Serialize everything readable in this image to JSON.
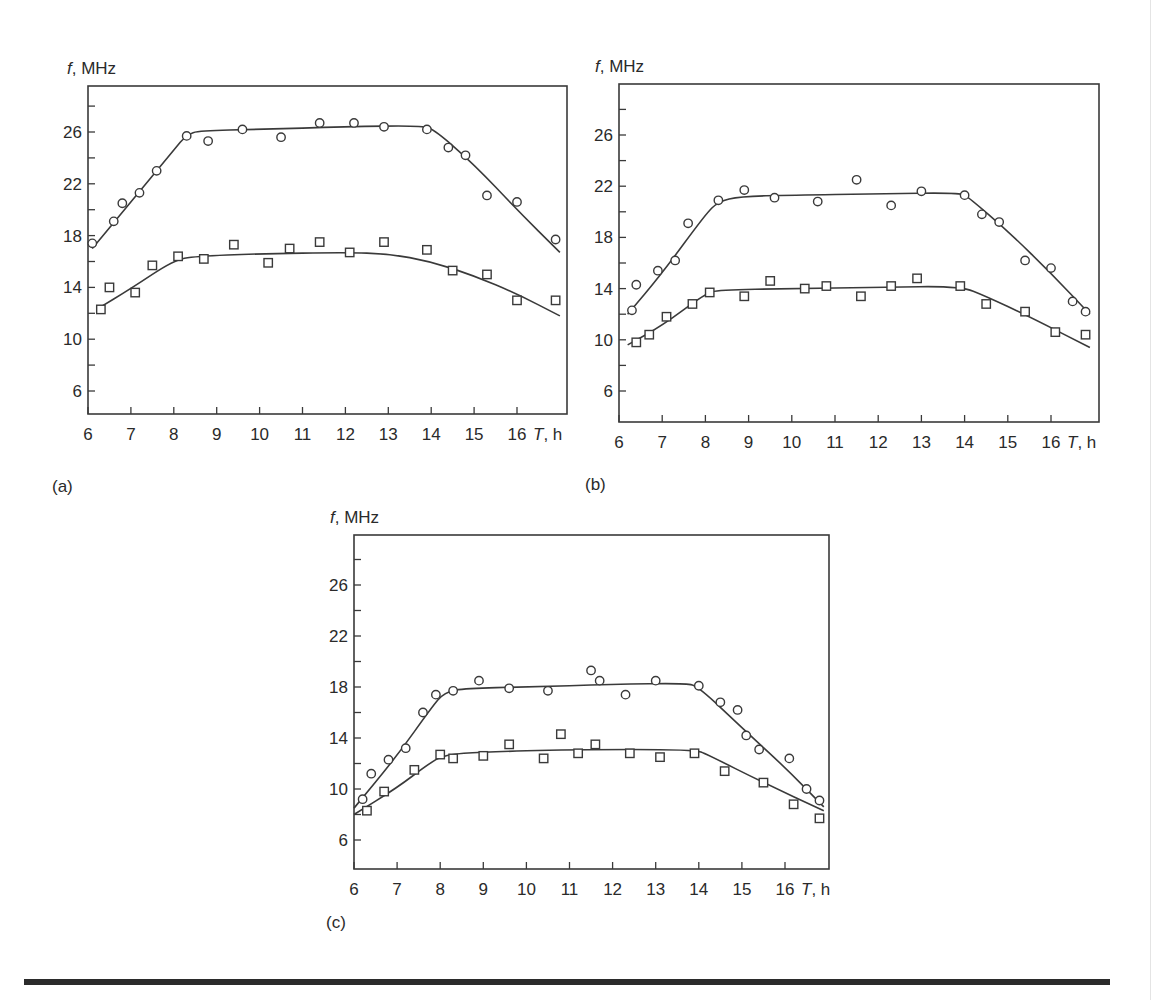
{
  "figure": {
    "y_unit_label": "f, MHz",
    "x_unit_label_italic": "T",
    "x_unit_label_rest": ", h",
    "panel_labels": [
      "(a)",
      "(b)",
      "(c)"
    ]
  },
  "chart_data": [
    {
      "type": "scatter",
      "panel": "(a)",
      "title": "",
      "xlabel": "T, h",
      "ylabel": "f, MHz",
      "xlim": [
        6,
        17
      ],
      "ylim": [
        4,
        30
      ],
      "x_ticks": [
        6,
        7,
        8,
        9,
        10,
        11,
        12,
        13,
        14,
        15,
        16
      ],
      "y_ticks_labeled": [
        6,
        10,
        14,
        18,
        22,
        26
      ],
      "y_ticks_minor": [
        8,
        12,
        16,
        20,
        24,
        28
      ],
      "grid": false,
      "legend": null,
      "series": [
        {
          "name": "circles",
          "marker": "circle",
          "points": [
            [
              6.1,
              17.4
            ],
            [
              6.6,
              19.1
            ],
            [
              6.8,
              20.5
            ],
            [
              7.2,
              21.3
            ],
            [
              7.6,
              23.0
            ],
            [
              8.3,
              25.7
            ],
            [
              8.8,
              25.3
            ],
            [
              9.6,
              26.2
            ],
            [
              10.5,
              25.6
            ],
            [
              11.4,
              26.7
            ],
            [
              12.2,
              26.7
            ],
            [
              12.9,
              26.4
            ],
            [
              13.9,
              26.2
            ],
            [
              14.4,
              24.8
            ],
            [
              14.8,
              24.2
            ],
            [
              15.3,
              21.1
            ],
            [
              16.0,
              20.6
            ],
            [
              16.9,
              17.7
            ]
          ],
          "fit_curve": [
            [
              6.1,
              17.0
            ],
            [
              7.0,
              20.6
            ],
            [
              8.0,
              24.6
            ],
            [
              8.3,
              25.8
            ],
            [
              8.6,
              26.1
            ],
            [
              10,
              26.2
            ],
            [
              12,
              26.4
            ],
            [
              13.8,
              26.5
            ],
            [
              14.1,
              26.1
            ],
            [
              15,
              23.5
            ],
            [
              16,
              20.0
            ],
            [
              17,
              16.7
            ]
          ]
        },
        {
          "name": "squares",
          "marker": "square",
          "points": [
            [
              6.3,
              12.3
            ],
            [
              6.5,
              14.0
            ],
            [
              7.1,
              13.6
            ],
            [
              7.5,
              15.7
            ],
            [
              8.1,
              16.4
            ],
            [
              8.7,
              16.2
            ],
            [
              9.4,
              17.3
            ],
            [
              10.2,
              15.9
            ],
            [
              10.7,
              17.0
            ],
            [
              11.4,
              17.5
            ],
            [
              12.1,
              16.7
            ],
            [
              12.9,
              17.5
            ],
            [
              13.9,
              16.9
            ],
            [
              14.5,
              15.3
            ],
            [
              15.3,
              15.0
            ],
            [
              16.0,
              13.0
            ],
            [
              16.9,
              13.0
            ]
          ],
          "fit_curve": [
            [
              6.2,
              12.3
            ],
            [
              7,
              13.9
            ],
            [
              8,
              16.1
            ],
            [
              8.5,
              16.4
            ],
            [
              10,
              16.6
            ],
            [
              12,
              16.7
            ],
            [
              13,
              16.6
            ],
            [
              14,
              16.0
            ],
            [
              15,
              14.9
            ],
            [
              16,
              13.5
            ],
            [
              17,
              11.8
            ]
          ]
        }
      ]
    },
    {
      "type": "scatter",
      "panel": "(b)",
      "title": "",
      "xlabel": "T, h",
      "ylabel": "f, MHz",
      "xlim": [
        6,
        17
      ],
      "ylim": [
        4,
        30
      ],
      "x_ticks": [
        6,
        7,
        8,
        9,
        10,
        11,
        12,
        13,
        14,
        15,
        16
      ],
      "y_ticks_labeled": [
        6,
        10,
        14,
        18,
        22,
        26
      ],
      "y_ticks_minor": [
        8,
        12,
        16,
        20,
        24,
        28
      ],
      "grid": false,
      "legend": null,
      "series": [
        {
          "name": "circles",
          "marker": "circle",
          "points": [
            [
              6.3,
              12.3
            ],
            [
              6.4,
              14.3
            ],
            [
              6.9,
              15.4
            ],
            [
              7.3,
              16.2
            ],
            [
              7.6,
              19.1
            ],
            [
              8.3,
              20.9
            ],
            [
              8.9,
              21.7
            ],
            [
              9.6,
              21.1
            ],
            [
              10.6,
              20.8
            ],
            [
              11.5,
              22.5
            ],
            [
              12.3,
              20.5
            ],
            [
              13.0,
              21.6
            ],
            [
              14.0,
              21.3
            ],
            [
              14.4,
              19.8
            ],
            [
              14.8,
              19.2
            ],
            [
              15.4,
              16.2
            ],
            [
              16.0,
              15.6
            ],
            [
              16.5,
              13.0
            ],
            [
              16.8,
              12.2
            ]
          ],
          "fit_curve": [
            [
              6.2,
              12.0
            ],
            [
              7,
              15.2
            ],
            [
              8,
              19.8
            ],
            [
              8.3,
              20.8
            ],
            [
              8.8,
              21.2
            ],
            [
              10,
              21.3
            ],
            [
              12,
              21.4
            ],
            [
              13.9,
              21.5
            ],
            [
              14.1,
              21.1
            ],
            [
              15,
              18.5
            ],
            [
              16,
              15.2
            ],
            [
              16.9,
              12.0
            ]
          ]
        },
        {
          "name": "squares",
          "marker": "square",
          "points": [
            [
              6.4,
              9.8
            ],
            [
              6.7,
              10.4
            ],
            [
              7.1,
              11.8
            ],
            [
              7.7,
              12.8
            ],
            [
              8.1,
              13.7
            ],
            [
              8.9,
              13.4
            ],
            [
              9.5,
              14.6
            ],
            [
              10.3,
              14.0
            ],
            [
              10.8,
              14.2
            ],
            [
              11.6,
              13.4
            ],
            [
              12.3,
              14.2
            ],
            [
              12.9,
              14.8
            ],
            [
              13.9,
              14.2
            ],
            [
              14.5,
              12.8
            ],
            [
              15.4,
              12.2
            ],
            [
              16.1,
              10.6
            ],
            [
              16.8,
              10.4
            ]
          ],
          "fit_curve": [
            [
              6.2,
              9.6
            ],
            [
              7,
              11.1
            ],
            [
              8,
              13.6
            ],
            [
              8.3,
              13.9
            ],
            [
              10,
              14.0
            ],
            [
              12,
              14.1
            ],
            [
              13.9,
              14.2
            ],
            [
              14.5,
              13.4
            ],
            [
              15.5,
              11.8
            ],
            [
              16.9,
              9.4
            ]
          ]
        }
      ]
    },
    {
      "type": "scatter",
      "panel": "(c)",
      "title": "",
      "xlabel": "T, h",
      "ylabel": "f, MHz",
      "xlim": [
        6,
        17
      ],
      "ylim": [
        4,
        30
      ],
      "x_ticks": [
        6,
        7,
        8,
        9,
        10,
        11,
        12,
        13,
        14,
        15,
        16
      ],
      "y_ticks_labeled": [
        6,
        10,
        14,
        18,
        22,
        26
      ],
      "y_ticks_minor": [
        8,
        12,
        16,
        20,
        24,
        28
      ],
      "grid": false,
      "legend": null,
      "series": [
        {
          "name": "circles",
          "marker": "circle",
          "points": [
            [
              6.2,
              9.2
            ],
            [
              6.4,
              11.2
            ],
            [
              6.8,
              12.3
            ],
            [
              7.2,
              13.2
            ],
            [
              7.6,
              16.0
            ],
            [
              7.9,
              17.4
            ],
            [
              8.3,
              17.7
            ],
            [
              8.9,
              18.5
            ],
            [
              9.6,
              17.9
            ],
            [
              10.5,
              17.7
            ],
            [
              11.5,
              19.3
            ],
            [
              11.7,
              18.5
            ],
            [
              12.3,
              17.4
            ],
            [
              13.0,
              18.5
            ],
            [
              14.0,
              18.1
            ],
            [
              14.5,
              16.8
            ],
            [
              14.9,
              16.2
            ],
            [
              15.1,
              14.2
            ],
            [
              15.4,
              13.1
            ],
            [
              16.1,
              12.4
            ],
            [
              16.5,
              10.0
            ],
            [
              16.8,
              9.1
            ]
          ],
          "fit_curve": [
            [
              6,
              8.5
            ],
            [
              7,
              12.6
            ],
            [
              7.8,
              16.4
            ],
            [
              8.1,
              17.6
            ],
            [
              8.6,
              17.9
            ],
            [
              10,
              18.0
            ],
            [
              12,
              18.2
            ],
            [
              13.7,
              18.3
            ],
            [
              14,
              18.0
            ],
            [
              15,
              14.8
            ],
            [
              16,
              11.7
            ],
            [
              16.9,
              8.6
            ]
          ]
        },
        {
          "name": "squares",
          "marker": "square",
          "points": [
            [
              6.3,
              8.3
            ],
            [
              6.7,
              9.8
            ],
            [
              7.4,
              11.5
            ],
            [
              8.0,
              12.7
            ],
            [
              8.3,
              12.4
            ],
            [
              9.0,
              12.6
            ],
            [
              9.6,
              13.5
            ],
            [
              10.4,
              12.4
            ],
            [
              10.8,
              14.3
            ],
            [
              11.2,
              12.8
            ],
            [
              11.6,
              13.5
            ],
            [
              12.4,
              12.8
            ],
            [
              13.1,
              12.5
            ],
            [
              13.9,
              12.8
            ],
            [
              14.6,
              11.4
            ],
            [
              15.5,
              10.5
            ],
            [
              16.2,
              8.8
            ],
            [
              16.8,
              7.7
            ]
          ],
          "fit_curve": [
            [
              6,
              8.0
            ],
            [
              7,
              10.1
            ],
            [
              7.7,
              11.9
            ],
            [
              8.1,
              12.7
            ],
            [
              9,
              12.9
            ],
            [
              11,
              13.1
            ],
            [
              13.9,
              13.1
            ],
            [
              14.2,
              12.7
            ],
            [
              15.5,
              10.5
            ],
            [
              16.9,
              8.3
            ]
          ]
        }
      ]
    }
  ]
}
